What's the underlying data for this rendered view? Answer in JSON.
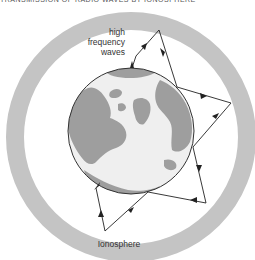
{
  "caption": "TRANSMISSION OF RADIO WAVES BY IONOSPHERE",
  "labels": {
    "waves_line1": "high",
    "waves_line2": "frequency",
    "waves_line3": "waves",
    "layer": "Ionosphere"
  },
  "colors": {
    "ionosphere": "#c4c4c4",
    "land": "#9e9e9e",
    "ocean": "#efefef",
    "path": "#222222",
    "background": "#ffffff"
  },
  "diagram": {
    "earth": {
      "cx": 131,
      "cy": 131,
      "r": 63
    },
    "ionosphere": {
      "cx": 131,
      "cy": 137,
      "r_outer": 125,
      "r_inner": 107
    },
    "transmitter": {
      "x": 132,
      "y": 68
    },
    "receiver": {
      "x": 96,
      "y": 188
    },
    "wave_path": [
      [
        136,
        56
      ],
      [
        159,
        30
      ],
      [
        177,
        87
      ],
      [
        231,
        103
      ],
      [
        193,
        147
      ],
      [
        206,
        203
      ],
      [
        148,
        192
      ],
      [
        105,
        231
      ],
      [
        96,
        188
      ]
    ]
  }
}
